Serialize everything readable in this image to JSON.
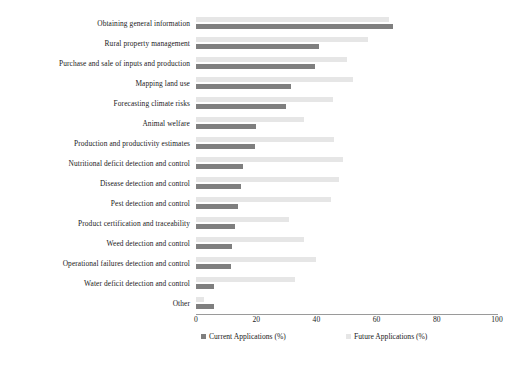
{
  "chart_data": {
    "type": "bar",
    "orientation": "horizontal",
    "title": "",
    "xlabel": "",
    "ylabel": "",
    "xlim": [
      0,
      100
    ],
    "xticks": [
      0,
      20,
      40,
      60,
      80,
      100
    ],
    "xtick_labels": [
      "0",
      "20",
      "40",
      "60",
      "80",
      "100"
    ],
    "grid": false,
    "legend_position": "bottom",
    "categories": [
      "Other",
      "Water deficit detection and control",
      "Operational failures detection and control",
      "Weed detection and control",
      "Product certification and traceability",
      "Pest detection and control",
      "Disease detection and control",
      "Nutritional deficit detection and control",
      "Production and productivity estimates",
      "Animal welfare",
      "Forecasting climate risks",
      "Mapping land use",
      "Purchase and sale of inputs and production",
      "Rural property management",
      "Obtaining general information"
    ],
    "series": [
      {
        "name": "Current Applications (%)",
        "color": "#7f7f7f",
        "values": [
          6,
          6,
          11.5,
          12,
          13,
          14,
          15,
          15.5,
          19.5,
          20,
          30,
          31.5,
          39.5,
          41,
          65.5
        ]
      },
      {
        "name": "Future Applications (%)",
        "color": "#e6e6e6",
        "values": [
          2.5,
          33,
          40,
          36,
          31,
          45,
          47.5,
          49,
          46,
          36,
          45.5,
          52,
          50,
          57,
          64
        ]
      }
    ]
  },
  "legend": {
    "items": [
      {
        "label": "Current Applications (%)",
        "color": "#7f7f7f"
      },
      {
        "label": "Future Applications (%)",
        "color": "#e6e6e6"
      }
    ]
  }
}
